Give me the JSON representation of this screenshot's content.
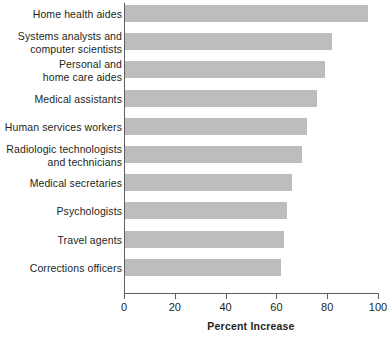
{
  "chart_data": {
    "type": "bar",
    "orientation": "horizontal",
    "title": "",
    "xlabel": "Percent Increase",
    "ylabel": "",
    "xlim": [
      0,
      100
    ],
    "xticks": [
      0,
      20,
      40,
      60,
      80,
      100
    ],
    "xtick_labels": [
      "0",
      "20",
      "40",
      "60",
      "80",
      "100"
    ],
    "grid": false,
    "legend": null,
    "bar_color": "#bdbdbd",
    "axis_color": "#5f5f5f",
    "text_color": "#231f20",
    "categories": [
      "Home health aides",
      "Systems analysts and\ncomputer scientists",
      "Personal and\nhome care aides",
      "Medical assistants",
      "Human services workers",
      "Radiologic technologists\nand technicians",
      "Medical secretaries",
      "Psychologists",
      "Travel agents",
      "Corrections officers"
    ],
    "values": [
      96,
      82,
      79,
      76,
      72,
      70,
      66,
      64,
      63,
      62
    ]
  }
}
